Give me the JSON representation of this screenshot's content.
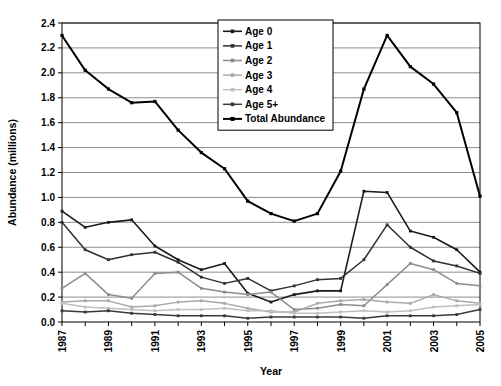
{
  "chart_data": {
    "type": "line",
    "title": "",
    "xlabel": "Year",
    "ylabel": "Abundance (millions)",
    "xlim": [
      1987,
      2005
    ],
    "ylim": [
      0.0,
      2.4
    ],
    "ytick_step": 0.2,
    "grid": "horizontal",
    "legend_position": "top-center",
    "x": [
      1987,
      1988,
      1989,
      1990,
      1991,
      1992,
      1993,
      1994,
      1995,
      1996,
      1997,
      1998,
      1999,
      2000,
      2001,
      2002,
      2003,
      2004,
      2005
    ],
    "xtick_labels": [
      "1987",
      "",
      "1989",
      "",
      "1991",
      "",
      "1993",
      "",
      "1995",
      "",
      "1997",
      "",
      "1999",
      "",
      "2001",
      "",
      "2003",
      "",
      "2005"
    ],
    "ytick_labels": [
      "0.0",
      "0.2",
      "0.4",
      "0.6",
      "0.8",
      "1.0",
      "1.2",
      "1.4",
      "1.6",
      "1.8",
      "2.0",
      "2.2",
      "2.4"
    ],
    "series": [
      {
        "name": "Age 0",
        "color": "#1a1a1a",
        "width": 1.6,
        "marker": "square",
        "values": [
          0.89,
          0.76,
          0.8,
          0.82,
          0.61,
          0.5,
          0.42,
          0.47,
          0.23,
          0.16,
          0.22,
          0.25,
          0.25,
          1.05,
          1.04,
          0.73,
          0.68,
          0.58,
          0.4
        ]
      },
      {
        "name": "Age 1",
        "color": "#303030",
        "width": 1.5,
        "marker": "square",
        "values": [
          0.8,
          0.58,
          0.5,
          0.54,
          0.56,
          0.48,
          0.36,
          0.31,
          0.35,
          0.25,
          0.29,
          0.34,
          0.35,
          0.5,
          0.78,
          0.6,
          0.49,
          0.45,
          0.39
        ]
      },
      {
        "name": "Age 2",
        "color": "#8c8c8c",
        "width": 1.5,
        "marker": "square",
        "values": [
          0.27,
          0.39,
          0.22,
          0.19,
          0.39,
          0.4,
          0.27,
          0.24,
          0.22,
          0.24,
          0.1,
          0.11,
          0.14,
          0.13,
          0.3,
          0.47,
          0.42,
          0.31,
          0.29
        ]
      },
      {
        "name": "Age 3",
        "color": "#a8a8a8",
        "width": 1.4,
        "marker": "square",
        "values": [
          0.16,
          0.17,
          0.17,
          0.12,
          0.13,
          0.16,
          0.17,
          0.15,
          0.11,
          0.08,
          0.08,
          0.15,
          0.17,
          0.18,
          0.16,
          0.15,
          0.22,
          0.17,
          0.15
        ]
      },
      {
        "name": "Age 4",
        "color": "#bfbfbf",
        "width": 1.4,
        "marker": "square",
        "values": [
          0.15,
          0.12,
          0.11,
          0.1,
          0.09,
          0.1,
          0.1,
          0.11,
          0.09,
          0.09,
          0.07,
          0.07,
          0.08,
          0.09,
          0.08,
          0.09,
          0.12,
          0.13,
          0.14
        ]
      },
      {
        "name": "Age 5+",
        "color": "#3a3a3a",
        "width": 1.5,
        "marker": "square",
        "values": [
          0.09,
          0.08,
          0.09,
          0.07,
          0.06,
          0.05,
          0.05,
          0.05,
          0.03,
          0.04,
          0.04,
          0.04,
          0.04,
          0.03,
          0.05,
          0.05,
          0.05,
          0.06,
          0.1
        ]
      },
      {
        "name": "Total Abundance",
        "color": "#000000",
        "width": 2.0,
        "marker": "square",
        "values": [
          2.3,
          2.02,
          1.87,
          1.76,
          1.77,
          1.54,
          1.36,
          1.23,
          0.97,
          0.87,
          0.81,
          0.87,
          1.21,
          1.87,
          2.3,
          2.05,
          1.91,
          1.68,
          1.01
        ]
      }
    ]
  }
}
